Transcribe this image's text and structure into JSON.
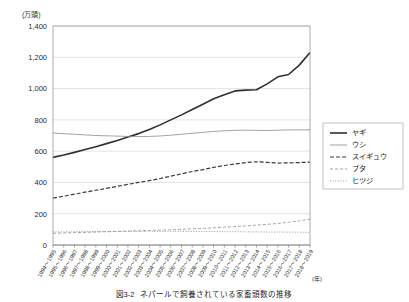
{
  "chart_data": {
    "type": "line",
    "title": "",
    "unit_label": "(万頭)",
    "xlabel": "(年)",
    "ylabel": "",
    "ylim": [
      0,
      1400
    ],
    "yticks": [
      "0",
      "200",
      "400",
      "600",
      "800",
      "1,000",
      "1,200",
      "1,400"
    ],
    "ytick_values": [
      0,
      200,
      400,
      600,
      800,
      1000,
      1200,
      1400
    ],
    "grid": true,
    "legend_position": "right",
    "categories": [
      "1994～1995",
      "1995～1996",
      "1996～1997",
      "1997～1998",
      "1998～1999",
      "1999～2000",
      "2000～2001",
      "2001～2002",
      "2002～2003",
      "2003～2004",
      "2004～2005",
      "2005～2006",
      "2006～2007",
      "2007～2008",
      "2008～2009",
      "2009～2010",
      "2010～2011",
      "2011～2012",
      "2012～2013",
      "2013～2014",
      "2014～2015",
      "2015～2016",
      "2016～2017",
      "2017～2018",
      "2018～2019"
    ],
    "series": [
      {
        "name": "ヤギ",
        "style": "solid-thick",
        "color": "#2f2f2f",
        "width": 1.6,
        "dash": "",
        "values": [
          560,
          575,
          592,
          610,
          628,
          648,
          668,
          690,
          712,
          738,
          768,
          800,
          832,
          866,
          900,
          935,
          960,
          985,
          990,
          992,
          1030,
          1075,
          1090,
          1150,
          1230
        ]
      },
      {
        "name": "ウシ",
        "style": "solid-thin",
        "color": "#8c8c8c",
        "width": 0.8,
        "dash": "",
        "values": [
          716,
          712,
          708,
          704,
          700,
          698,
          696,
          694,
          693,
          694,
          697,
          702,
          708,
          714,
          720,
          726,
          730,
          733,
          734,
          733,
          732,
          734,
          736,
          736,
          737
        ]
      },
      {
        "name": "スイギュウ",
        "style": "dashed",
        "color": "#3a3a3a",
        "width": 1.2,
        "dash": "4,2",
        "values": [
          300,
          312,
          325,
          338,
          350,
          362,
          375,
          388,
          400,
          412,
          425,
          440,
          455,
          470,
          482,
          496,
          508,
          518,
          527,
          532,
          528,
          524,
          525,
          527,
          530
        ]
      },
      {
        "name": "ブタ",
        "style": "dashed-light",
        "color": "#9a9a9a",
        "width": 0.9,
        "dash": "3,2",
        "values": [
          75,
          77,
          79,
          81,
          83,
          85,
          87,
          89,
          91,
          93,
          95,
          97,
          100,
          103,
          106,
          110,
          114,
          118,
          122,
          127,
          132,
          138,
          145,
          154,
          165
        ]
      },
      {
        "name": "ヒツジ",
        "style": "dotted",
        "color": "#8f8f8f",
        "width": 0.9,
        "dash": "1,1.6",
        "values": [
          84,
          84,
          85,
          85,
          86,
          86,
          86,
          87,
          87,
          87,
          87,
          87,
          87,
          86,
          86,
          86,
          85,
          85,
          84,
          84,
          83,
          83,
          82,
          82,
          81
        ]
      }
    ]
  },
  "caption": {
    "figure_label": "図3-2",
    "text": "ネパールで飼養されている家畜頭数の推移"
  }
}
